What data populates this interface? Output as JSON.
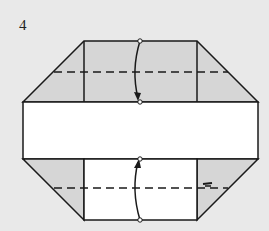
{
  "step": {
    "number": "4"
  },
  "diagram": {
    "type": "origami-fold-step",
    "colors": {
      "background": "#e9e9e9",
      "paper_colored": "#d6d6d6",
      "paper_white": "#ffffff",
      "line": "#1a1a1a"
    },
    "folds": [
      {
        "name": "top-valley-fold",
        "direction": "down"
      },
      {
        "name": "bottom-valley-fold",
        "direction": "up"
      }
    ]
  }
}
